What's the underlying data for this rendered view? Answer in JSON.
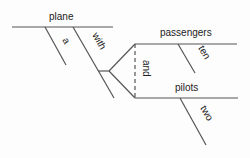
{
  "diagram": {
    "type": "sentence-diagram",
    "subject": "plane",
    "modifiers": {
      "article": "a",
      "preposition": "with",
      "conjunction": "and",
      "objects": [
        {
          "word": "passengers",
          "modifier": "ten"
        },
        {
          "word": "pilots",
          "modifier": "two"
        }
      ]
    },
    "colors": {
      "line": "#555555",
      "text": "#222222"
    }
  }
}
